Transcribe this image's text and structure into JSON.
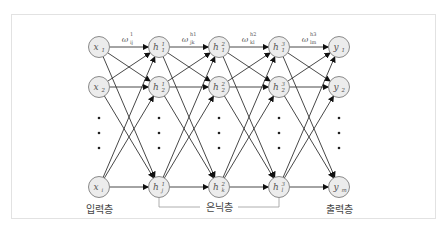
{
  "diagram": {
    "type": "neural-network",
    "layers": [
      {
        "id": "input",
        "label": "입력층",
        "nodes": [
          {
            "base": "x",
            "sub": "1",
            "sup": ""
          },
          {
            "base": "x",
            "sub": "2",
            "sup": ""
          },
          {
            "base": "x",
            "sub": "i",
            "sup": ""
          }
        ]
      },
      {
        "id": "hidden1",
        "label": "",
        "nodes": [
          {
            "base": "h",
            "sub": "1",
            "sup": "1"
          },
          {
            "base": "h",
            "sub": "2",
            "sup": "1"
          },
          {
            "base": "h",
            "sub": "j",
            "sup": "1"
          }
        ]
      },
      {
        "id": "hidden2",
        "label": "",
        "nodes": [
          {
            "base": "h",
            "sub": "1",
            "sup": "2"
          },
          {
            "base": "h",
            "sub": "2",
            "sup": "2"
          },
          {
            "base": "h",
            "sub": "k",
            "sup": "2"
          }
        ]
      },
      {
        "id": "hidden3",
        "label": "",
        "nodes": [
          {
            "base": "h",
            "sub": "1",
            "sup": "3"
          },
          {
            "base": "h",
            "sub": "2",
            "sup": "3"
          },
          {
            "base": "h",
            "sub": "l",
            "sup": "3"
          }
        ]
      },
      {
        "id": "output",
        "label": "출력층",
        "nodes": [
          {
            "base": "y",
            "sub": "1",
            "sup": ""
          },
          {
            "base": "y",
            "sub": "2",
            "sup": ""
          },
          {
            "base": "y",
            "sub": "m",
            "sup": ""
          }
        ]
      }
    ],
    "weights": [
      {
        "base": "ω",
        "sub": "ij",
        "sup": "1"
      },
      {
        "base": "ω",
        "sub": "jk",
        "sup": "h1"
      },
      {
        "base": "ω",
        "sub": "kl",
        "sup": "h2"
      },
      {
        "base": "ω",
        "sub": "lm",
        "sup": "h3"
      }
    ],
    "hidden_label": "은닉층",
    "input_label": "입력층",
    "output_label": "출력층"
  }
}
